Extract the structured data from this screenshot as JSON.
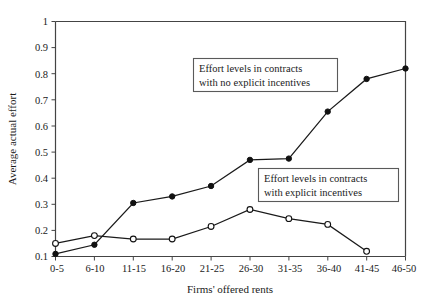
{
  "chart_data": {
    "type": "line",
    "title": "",
    "xlabel": "Firms' offered rents",
    "ylabel": "Average actual effort",
    "categories": [
      "0-5",
      "6-10",
      "11-15",
      "16-20",
      "21-25",
      "26-30",
      "31-35",
      "36-40",
      "41-45",
      "46-50"
    ],
    "yticks": [
      "0.1",
      "0.2",
      "0.3",
      "0.4",
      "0.5",
      "0.6",
      "0.7",
      "0.8",
      "0.9",
      "1"
    ],
    "ylim": [
      0.1,
      1.0
    ],
    "grid": false,
    "legend_position": "inline-annotations",
    "series": [
      {
        "name": "Effort levels in contracts with explicit incentives",
        "marker": "filled-circle",
        "values": [
          0.11,
          0.145,
          0.305,
          0.33,
          0.37,
          0.47,
          0.475,
          0.655,
          0.78,
          0.82
        ]
      },
      {
        "name": "Effort levels in contracts with no explicit incentives",
        "marker": "open-circle",
        "values": [
          0.15,
          0.18,
          0.167,
          0.167,
          0.215,
          0.28,
          0.245,
          0.223,
          0.12,
          null
        ]
      }
    ],
    "annotations": [
      {
        "id": "annotation-no-incentives",
        "line1": "Effort levels in contracts",
        "line2": "with no explicit incentives"
      },
      {
        "id": "annotation-explicit-incentives",
        "line1": "Effort levels in contracts",
        "line2": "with explicit incentives"
      }
    ],
    "colors": {
      "axis": "#444444",
      "line": "#1a1a1a",
      "marker_filled": "#111111",
      "marker_open_fill": "#ffffff",
      "annotation_border": "#5a5a5a",
      "background": "#ffffff"
    }
  }
}
